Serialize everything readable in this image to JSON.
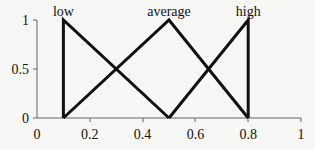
{
  "chart_data": {
    "type": "line",
    "title": "",
    "xlabel": "",
    "ylabel": "",
    "xlim": [
      0,
      1
    ],
    "ylim": [
      0,
      1
    ],
    "x_ticks": [
      "0",
      "0.2",
      "0.4",
      "0.6",
      "0.8",
      "1"
    ],
    "y_ticks": [
      "0",
      "0.5",
      "1"
    ],
    "grid": false,
    "legend": "none",
    "series": [
      {
        "name": "low",
        "x": [
          0.1,
          0.1,
          0.5
        ],
        "y": [
          0,
          1,
          0
        ]
      },
      {
        "name": "average",
        "x": [
          0.1,
          0.5,
          0.8
        ],
        "y": [
          0,
          1,
          0
        ]
      },
      {
        "name": "high",
        "x": [
          0.5,
          0.8,
          0.8
        ],
        "y": [
          0,
          1,
          0
        ]
      }
    ],
    "annotations": [
      {
        "text": "low",
        "x": 0.1,
        "y": 1
      },
      {
        "text": "average",
        "x": 0.5,
        "y": 1
      },
      {
        "text": "high",
        "x": 0.8,
        "y": 1
      }
    ]
  },
  "colors": {
    "line": "#111111",
    "axis": "#555555",
    "background": "#f7f7f5"
  }
}
